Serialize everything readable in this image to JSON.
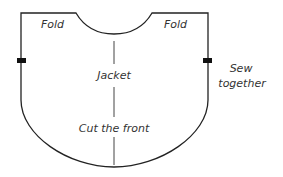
{
  "diagram": {
    "labels": {
      "fold_left": "Fold",
      "fold_right": "Fold",
      "center": "Jacket",
      "cut": "Cut the front",
      "sew_line1": "Sew",
      "sew_line2": "together"
    },
    "colors": {
      "outline": "#222222",
      "centerline": "#444444",
      "text": "#333333",
      "notch": "#111111"
    }
  }
}
